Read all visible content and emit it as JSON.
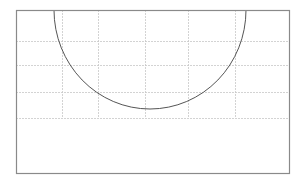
{
  "diagram": {
    "type": "geometric-figure",
    "colors": {
      "background": "#ffffff",
      "frame": "#8a8a8a",
      "grid": "#c8c8c8",
      "arc": "#555555"
    },
    "frame": {
      "x": 16,
      "y": 10,
      "width": 273,
      "height": 163
    },
    "grid": {
      "vertical_x": [
        62,
        98,
        145,
        188,
        235
      ],
      "horizontal_y": [
        41,
        65,
        92,
        118
      ],
      "vertical_y_range": [
        10,
        118
      ],
      "horizontal_x_range": [
        16,
        289
      ],
      "style": "dashed"
    },
    "arc": {
      "center_x": 150,
      "center_y": 10,
      "radius_x": 96,
      "radius_y": 99,
      "start": [
        54,
        10
      ],
      "end": [
        246,
        10
      ],
      "lowest_point": [
        150,
        109
      ]
    }
  }
}
